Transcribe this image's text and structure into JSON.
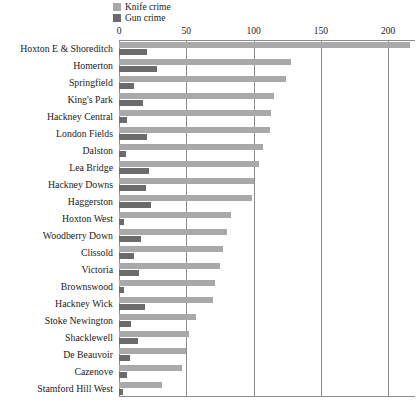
{
  "chart_data": {
    "type": "bar",
    "orientation": "horizontal",
    "title": "",
    "xlabel": "",
    "ylabel": "",
    "xlim": [
      0,
      220
    ],
    "xticks": [
      0,
      50,
      100,
      150,
      200
    ],
    "xtick_labels": [
      "0",
      "50",
      "100",
      "150",
      "200"
    ],
    "grid": "vertical",
    "legend_position": "top-left",
    "colors": {
      "knife_crime": "#a9a9a9",
      "gun_crime": "#6b6b6b",
      "axis": "#8d8d8d",
      "background": "#ffffff",
      "text": "#1a1a1a"
    },
    "categories": [
      "Hoxton E & Shoreditch",
      "Homerton",
      "Springfield",
      "King's Park",
      "Hackney Central",
      "London Fields",
      "Dalston",
      "Lea Bridge",
      "Hackney Downs",
      "Haggerston",
      "Hoxton West",
      "Woodberry Down",
      "Clissold",
      "Victoria",
      "Brownswood",
      "Hackney Wick",
      "Stoke Newington",
      "Shacklewell",
      "De Beauvoir",
      "Cazenove",
      "Stamford Hill West"
    ],
    "series": [
      {
        "name": "Knife crime",
        "color": "#a9a9a9",
        "values": [
          216,
          128,
          124,
          115,
          113,
          112,
          107,
          104,
          100,
          99,
          83,
          80,
          77,
          75,
          71,
          70,
          57,
          52,
          50,
          47,
          32
        ]
      },
      {
        "name": "Gun crime",
        "color": "#6b6b6b",
        "values": [
          21,
          28,
          11,
          18,
          6,
          21,
          5,
          22,
          20,
          24,
          4,
          16,
          11,
          15,
          4,
          19,
          9,
          14,
          8,
          6,
          3
        ]
      }
    ]
  },
  "legend": {
    "items": [
      {
        "label": "Knife crime",
        "color": "#a9a9a9"
      },
      {
        "label": "Gun crime",
        "color": "#6b6b6b"
      }
    ]
  }
}
